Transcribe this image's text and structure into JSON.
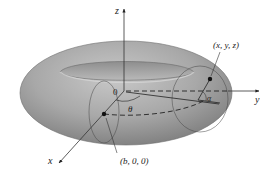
{
  "figure": {
    "type": "torus-parametrization",
    "axes": {
      "x_label": "x",
      "y_label": "y",
      "z_label": "z",
      "origin_label": "0"
    },
    "angles": {
      "theta_label": "θ",
      "alpha_label": "α"
    },
    "points": {
      "general_point_label": "(x, y, z)",
      "center_point_label": "(b, 0, 0)"
    },
    "colors": {
      "torus_fill": "#9a9a9a",
      "torus_highlight": "#c4c4c4",
      "line": "#333333",
      "background": "#ffffff"
    }
  }
}
